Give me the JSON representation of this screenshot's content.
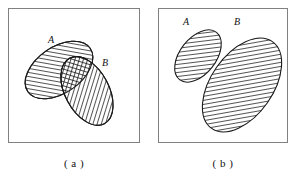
{
  "figure": {
    "type": "venn-diagram-pair",
    "background_color": "#ffffff",
    "line_color": "#1a1a1a",
    "frame_color": "#808080",
    "hatch_color": "#1a1a1a",
    "panels": [
      {
        "key": "a",
        "caption": "( a )",
        "description": "Two overlapping hatched ellipses labelled A and B; the intersection is cross-hatched",
        "overlap": true,
        "sets": [
          {
            "id": "A",
            "label": "A",
            "label_x": 40,
            "label_y": 30,
            "cx": 51,
            "cy": 62,
            "rx": 38,
            "ry": 23,
            "rotation": -35,
            "hatch": "forward"
          },
          {
            "id": "B",
            "label": "B",
            "label_y": 53,
            "label_x": 94,
            "cx": 79,
            "cy": 83,
            "rx": 37,
            "ry": 22,
            "rotation": 62,
            "hatch": "forward"
          }
        ]
      },
      {
        "key": "b",
        "caption": "( b )",
        "description": "Two disjoint hatched ellipses labelled A and B; A is small, B is large, no intersection",
        "overlap": false,
        "sets": [
          {
            "id": "A",
            "label": "A",
            "label_x": 25,
            "label_y": 12,
            "cx": 40,
            "cy": 48,
            "rx": 30,
            "ry": 18,
            "rotation": -52,
            "hatch": "forward"
          },
          {
            "id": "B",
            "label": "B",
            "label_x": 76,
            "label_y": 12,
            "cx": 84,
            "cy": 77,
            "rx": 53,
            "ry": 31,
            "rotation": -55,
            "hatch": "forward"
          }
        ]
      }
    ]
  }
}
